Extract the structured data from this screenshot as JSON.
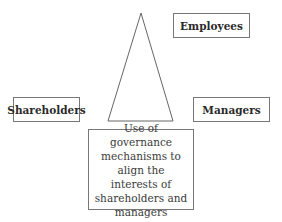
{
  "diagram": {
    "nodes": {
      "employees": "Employees",
      "shareholders": "Shareholders",
      "managers": "Managers"
    },
    "description": "Use of governance mechanisms to align the interests of shareholders and managers",
    "shape": "triangle",
    "colors": {
      "border": "#777777",
      "text": "#333333",
      "background": "#ffffff"
    }
  }
}
